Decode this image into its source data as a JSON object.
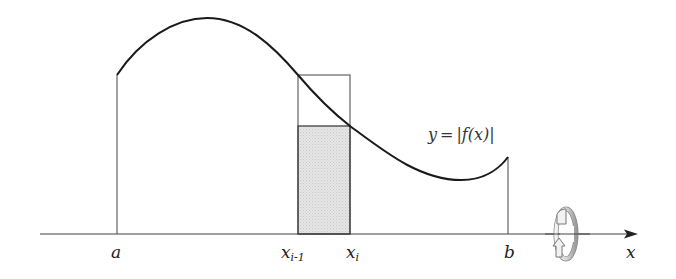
{
  "diagram": {
    "type": "riemann-rectangle-solid-of-revolution",
    "curve_label": {
      "lhs": "y",
      "equals": "=",
      "rhs": "|f(x)|"
    },
    "axis": {
      "label": "x",
      "start_x": 40,
      "end_x": 638,
      "y": 234
    },
    "ticks": [
      {
        "id": "a",
        "label": "a",
        "subscript": "",
        "x": 117
      },
      {
        "id": "x_i_minus_1",
        "label": "x",
        "subscript": "i-1",
        "x": 298
      },
      {
        "id": "x_i",
        "label": "x",
        "subscript": "i",
        "x": 350
      },
      {
        "id": "b",
        "label": "b",
        "subscript": "",
        "x": 508
      }
    ],
    "curve_points": {
      "start": [
        117,
        75
      ],
      "peak": [
        207,
        18
      ],
      "rect_left_hit": [
        298,
        75
      ],
      "rect_right_hit": [
        350,
        126
      ],
      "minimum": [
        461,
        180
      ],
      "end": [
        508,
        157
      ]
    },
    "outer_rectangle": {
      "x_left": 298,
      "x_right": 350,
      "top_y": 75
    },
    "shaded_rectangle": {
      "x_left": 298,
      "x_right": 350,
      "top_y": 126,
      "fill": "#e2e2e2"
    },
    "rotation_icon": {
      "name": "rotation-arrow-icon",
      "cx": 566,
      "cy": 234
    },
    "colors": {
      "curve": "#1a1a1a",
      "lines": "#444444",
      "shade": "#e0e0e0",
      "background": "#ffffff"
    }
  }
}
